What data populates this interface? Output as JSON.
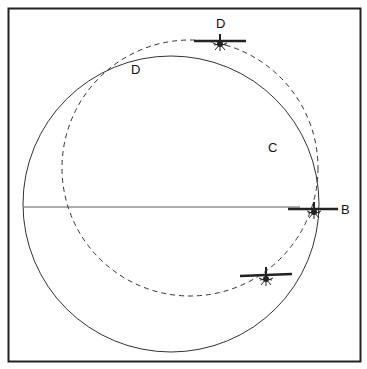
{
  "diagram": {
    "labels": {
      "d_top": "D",
      "d_circle": "D",
      "c": "C",
      "b": "B"
    },
    "elements": [
      {
        "type": "frame",
        "description": "square border"
      },
      {
        "type": "solid-circle",
        "description": "flight path circle"
      },
      {
        "type": "dashed-circle",
        "description": "drifted ground track"
      },
      {
        "type": "horizontal-line",
        "description": "reference line to point B"
      },
      {
        "type": "airplane",
        "position": "top",
        "label": "D"
      },
      {
        "type": "airplane",
        "position": "right",
        "label": "B"
      },
      {
        "type": "airplane",
        "position": "lower-right"
      }
    ],
    "colors": {
      "line": "#222222",
      "background": "#ffffff"
    }
  }
}
